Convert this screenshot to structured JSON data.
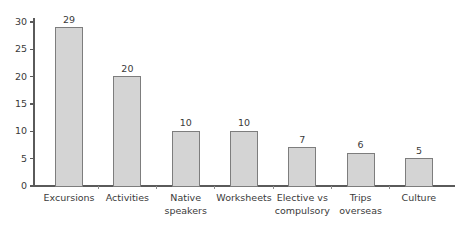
{
  "chart_data": {
    "type": "bar",
    "title": "",
    "subtitle": "",
    "xlabel": "",
    "ylabel": "",
    "categories": [
      "Excursions",
      "Native speakers",
      "Activities",
      "Worksheets",
      "Elective vs compulsory",
      "Trips overseas",
      "Culture"
    ],
    "category_lines": [
      [
        "Excursions"
      ],
      [
        "Activities"
      ],
      [
        "Native",
        "speakers"
      ],
      [
        "Worksheets"
      ],
      [
        "Elective vs",
        "compulsory"
      ],
      [
        "Trips",
        "overseas"
      ],
      [
        "Culture"
      ]
    ],
    "category_labels_ordered": [
      "Excursions",
      "Activities",
      "Native speakers",
      "Worksheets",
      "Elective vs compulsory",
      "Trips overseas",
      "Culture"
    ],
    "values": [
      29,
      20,
      10,
      10,
      7,
      6,
      5
    ],
    "value_labels": [
      "29",
      "20",
      "10",
      "10",
      "7",
      "6",
      "5"
    ],
    "ylim": [
      0,
      30
    ],
    "ytick_values": [
      0,
      5,
      10,
      15,
      20,
      25,
      30
    ],
    "ytick_labels": [
      "0",
      "5",
      "10",
      "15",
      "20",
      "25",
      "30"
    ],
    "grid": false,
    "legend": false,
    "legend_position": "none",
    "show_value_labels": true,
    "colors": {
      "bar_fill": "#d4d4d4",
      "bar_border": "#7d7d7d",
      "axis": "#5a5a5a",
      "text": "#3a3a3a",
      "background": "#ffffff"
    }
  }
}
